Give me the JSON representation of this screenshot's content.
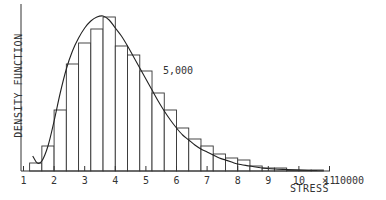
{
  "chart_data": {
    "type": "bar",
    "subtype": "histogram-with-density-curve",
    "title": "",
    "xlabel": "STRESS",
    "ylabel": "DENSITY FUNCTION",
    "x_scale_label": "× 10000",
    "annotation": "5,000",
    "xlim": [
      1,
      11
    ],
    "x_ticks": [
      "1",
      "2",
      "3",
      "4",
      "5",
      "6",
      "7",
      "8",
      "9",
      "10",
      "11"
    ],
    "y_ticks": [],
    "grid": false,
    "legend": null,
    "bin_width": 0.4,
    "bins": [
      {
        "x0": 1.2,
        "x1": 1.6,
        "height": 8
      },
      {
        "x0": 1.6,
        "x1": 2.0,
        "height": 25
      },
      {
        "x0": 2.0,
        "x1": 2.4,
        "height": 61
      },
      {
        "x0": 2.4,
        "x1": 2.8,
        "height": 107
      },
      {
        "x0": 2.8,
        "x1": 3.2,
        "height": 128
      },
      {
        "x0": 3.2,
        "x1": 3.6,
        "height": 142
      },
      {
        "x0": 3.6,
        "x1": 4.0,
        "height": 154
      },
      {
        "x0": 4.0,
        "x1": 4.4,
        "height": 125
      },
      {
        "x0": 4.4,
        "x1": 4.8,
        "height": 116
      },
      {
        "x0": 4.8,
        "x1": 5.2,
        "height": 100
      },
      {
        "x0": 5.2,
        "x1": 5.6,
        "height": 78
      },
      {
        "x0": 5.6,
        "x1": 6.0,
        "height": 61
      },
      {
        "x0": 6.0,
        "x1": 6.4,
        "height": 43
      },
      {
        "x0": 6.4,
        "x1": 6.8,
        "height": 32
      },
      {
        "x0": 6.8,
        "x1": 7.2,
        "height": 25
      },
      {
        "x0": 7.2,
        "x1": 7.6,
        "height": 17
      },
      {
        "x0": 7.6,
        "x1": 8.0,
        "height": 13
      },
      {
        "x0": 8.0,
        "x1": 8.4,
        "height": 11
      },
      {
        "x0": 8.4,
        "x1": 8.8,
        "height": 5
      },
      {
        "x0": 8.8,
        "x1": 9.2,
        "height": 3
      },
      {
        "x0": 9.2,
        "x1": 9.6,
        "height": 3
      },
      {
        "x0": 9.6,
        "x1": 10.0,
        "height": 1
      },
      {
        "x0": 10.0,
        "x1": 10.4,
        "height": 1
      },
      {
        "x0": 10.4,
        "x1": 10.8,
        "height": 1
      }
    ],
    "curve": {
      "x": [
        1.3,
        1.45,
        1.6,
        1.8,
        2.0,
        2.2,
        2.4,
        2.6,
        2.8,
        3.0,
        3.2,
        3.4,
        3.6,
        3.8,
        4.0,
        4.2,
        4.4,
        4.6,
        4.8,
        5.0,
        5.2,
        5.4,
        5.6,
        5.8,
        6.0,
        6.2,
        6.4,
        6.6,
        6.8,
        7.0,
        7.2,
        7.4,
        7.6,
        7.8,
        8.0,
        8.4,
        8.8,
        9.2,
        9.6,
        10.0,
        10.4,
        10.6
      ],
      "y": [
        15,
        8,
        10,
        25,
        50,
        78,
        102,
        120,
        133,
        143,
        150,
        154,
        155,
        151,
        143,
        135,
        125,
        114,
        103,
        92,
        81,
        70,
        60,
        51,
        43,
        36,
        31,
        26,
        22,
        19,
        16,
        13,
        11,
        9,
        7,
        5,
        3,
        2,
        1.5,
        1,
        0.5,
        0.5
      ]
    },
    "ylim": [
      0,
      165
    ]
  }
}
